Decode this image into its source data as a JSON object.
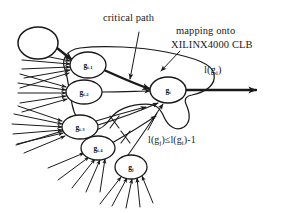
{
  "figure": {
    "title": "Critical path gate clustering mapped onto a XILINX4000 CLB",
    "style": "hand-drawn technical diagram",
    "background_color": "#ffffff",
    "ink_color": "#1a1a1a",
    "width": 286,
    "height": 213
  },
  "annotations": {
    "critical_path": "critical path",
    "mapping_line1": "mapping onto",
    "mapping_line2": "XILINX4000 CLB",
    "output_label_text": "l(g",
    "output_label_sub": "i",
    "output_label_tail": ")",
    "output_label_full": "l(g_i)",
    "inequality_full": "l(g_j)≤l(g_i)-1",
    "inequality_parts": {
      "p1": "l(g",
      "s1": "j",
      "p2": ")≤l(g",
      "s2": "i",
      "p3": ")-1"
    }
  },
  "nodes": [
    {
      "id": "source",
      "label": "",
      "sub": "",
      "cx": 38,
      "cy": 43,
      "rx": 20,
      "ry": 16,
      "in_clb": false,
      "on_critical_path": true
    },
    {
      "id": "g_im1",
      "label": "g",
      "sub": "i-1",
      "cx": 88,
      "cy": 65,
      "rx": 18,
      "ry": 13,
      "in_clb": true,
      "on_critical_path": true
    },
    {
      "id": "g_im2",
      "label": "g",
      "sub": "i-2",
      "cx": 84,
      "cy": 92,
      "rx": 18,
      "ry": 12,
      "in_clb": true,
      "on_critical_path": false
    },
    {
      "id": "g_im3",
      "label": "g",
      "sub": "i-3",
      "cx": 80,
      "cy": 127,
      "rx": 18,
      "ry": 12,
      "in_clb": true,
      "on_critical_path": false
    },
    {
      "id": "g_im4",
      "label": "g",
      "sub": "i-4",
      "cx": 98,
      "cy": 148,
      "rx": 17,
      "ry": 12,
      "in_clb": true,
      "on_critical_path": false
    },
    {
      "id": "g_i",
      "label": "g",
      "sub": "i",
      "cx": 168,
      "cy": 90,
      "rx": 18,
      "ry": 13,
      "in_clb": true,
      "on_critical_path": true
    },
    {
      "id": "g_j",
      "label": "g",
      "sub": "j",
      "cx": 131,
      "cy": 167,
      "rx": 16,
      "ry": 12,
      "in_clb": false,
      "on_critical_path": false
    }
  ],
  "edges": {
    "critical_path_bold": [
      {
        "from": "source",
        "to": "g_im1"
      },
      {
        "from": "g_im1",
        "to": "g_i"
      },
      {
        "from": "g_i",
        "to": "output"
      }
    ],
    "normal": [
      {
        "from": "g_im2",
        "to": "g_i"
      },
      {
        "from": "g_j",
        "to": "g_i"
      }
    ],
    "crossed_out": [
      {
        "from": "g_im3",
        "to": "g_i",
        "marker": "x"
      },
      {
        "from": "g_im4",
        "to": "g_i",
        "marker": "x"
      }
    ]
  },
  "markers": {
    "cross_count": 2,
    "fanin_arrow_groups": [
      {
        "node": "g_im1",
        "count": 5
      },
      {
        "node": "g_im2",
        "count": 5
      },
      {
        "node": "g_im3",
        "count": 6
      },
      {
        "node": "g_im4",
        "count": 5
      },
      {
        "node": "g_j",
        "count": 5
      }
    ]
  },
  "clb_region": {
    "name": "XILINX4000 CLB boundary",
    "contains": [
      "g_im1",
      "g_im2",
      "g_im3",
      "g_im4",
      "g_i"
    ]
  }
}
